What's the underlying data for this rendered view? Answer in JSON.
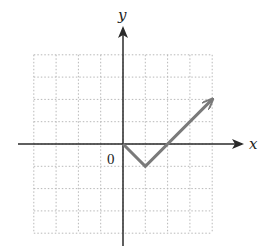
{
  "chart_data": {
    "type": "line",
    "title": "",
    "xlabel": "x",
    "ylabel": "y",
    "origin_label": "0",
    "grid": true,
    "xlim": [
      -4,
      4
    ],
    "ylim": [
      -4,
      4
    ],
    "series": [
      {
        "name": "f(x) = |x - 1| - 1, x ≥ 0",
        "x": [
          0,
          1,
          4
        ],
        "y": [
          0,
          -1,
          2
        ],
        "color": "#7a7a7a",
        "end_arrow": true
      }
    ]
  },
  "colors": {
    "axis": "#2a2a2a",
    "grid": "#b8b8b8",
    "curve": "#7a7a7a"
  }
}
